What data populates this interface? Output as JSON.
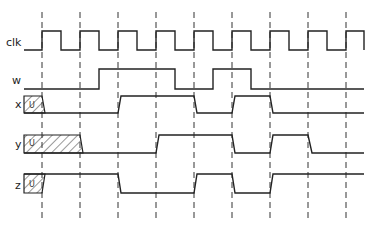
{
  "diagram": {
    "type": "timing-diagram",
    "signals": [
      {
        "name": "clk",
        "label": "clk"
      },
      {
        "name": "w",
        "label": "w"
      },
      {
        "name": "x",
        "label": "x",
        "initial": "U"
      },
      {
        "name": "y",
        "label": "y",
        "initial": "U"
      },
      {
        "name": "z",
        "label": "z",
        "initial": "U"
      }
    ],
    "unknown_label": "U",
    "clock_edges": 9,
    "colors": {
      "line": "#222222",
      "background": "#ffffff"
    }
  }
}
